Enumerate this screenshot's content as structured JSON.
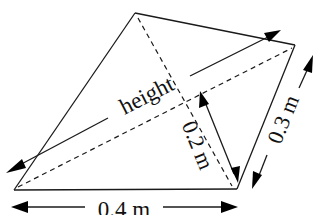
{
  "diagram": {
    "type": "geometry-quadrilateral",
    "vertices": {
      "top": [
        135,
        13
      ],
      "right": [
        295,
        45
      ],
      "bottom_right": [
        237,
        189
      ],
      "bottom_left": [
        14,
        190
      ]
    },
    "labels": {
      "height": "height",
      "height_short": "0.2 m",
      "side": "0.3 m",
      "base": "0.4 m"
    },
    "colors": {
      "stroke": "#1a1a1a",
      "arrowhead": "#000000",
      "background": "#ffffff"
    }
  }
}
